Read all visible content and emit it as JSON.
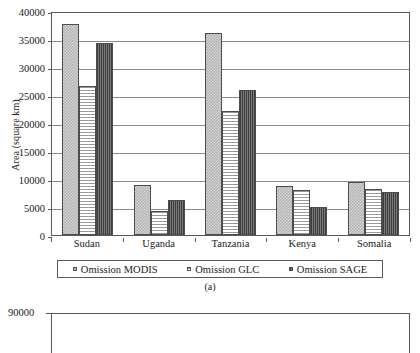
{
  "chart_data": {
    "type": "bar",
    "title": "",
    "caption": "(a)",
    "xlabel": "",
    "ylabel": "Area (square km)",
    "categories": [
      "Sudan",
      "Uganda",
      "Tanzania",
      "Kenya",
      "Somalia"
    ],
    "series": [
      {
        "name": "Omission MODIS",
        "values": [
          37700,
          9000,
          36100,
          8700,
          9400
        ],
        "pattern": "light-checker",
        "color": "#b5b5b5"
      },
      {
        "name": "Omission GLC",
        "values": [
          26600,
          4300,
          22200,
          8000,
          8200
        ],
        "pattern": "horizontal-stripe",
        "color": "#ffffff"
      },
      {
        "name": "Omission SAGE",
        "values": [
          34300,
          6200,
          25900,
          5000,
          7700
        ],
        "pattern": "vertical-stripe-dark",
        "color": "#5c5c5c"
      }
    ],
    "ylim": [
      0,
      40000
    ],
    "yticks": [
      0,
      5000,
      10000,
      15000,
      20000,
      25000,
      30000,
      35000,
      40000
    ],
    "ytick_labels": [
      "0",
      "5000",
      "10000",
      "15000",
      "20000",
      "25000",
      "30000",
      "35000",
      "40000"
    ],
    "grid": true,
    "legend_position": "below-axes"
  },
  "chart_b": {
    "type": "bar",
    "ytick_labels": [
      "90000"
    ],
    "note": "partially visible below figure (a)"
  }
}
